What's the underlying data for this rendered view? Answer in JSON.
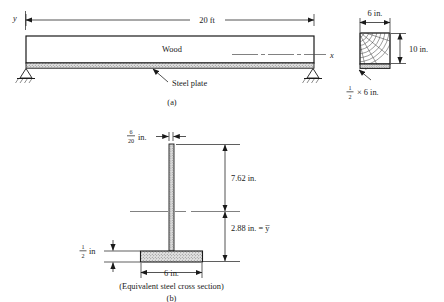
{
  "figure": {
    "title_a": "(a)",
    "title_b": "(b)",
    "caption_b": "(Equivalent steel cross section)"
  },
  "beam_elevation": {
    "span_label": "20 ft",
    "material_label": "Wood",
    "plate_label": "Steel plate",
    "axis_y_label": "y",
    "axis_x_label": "x"
  },
  "cross_section": {
    "width_label": "6 in.",
    "depth_label": "10 in.",
    "plate_label_numerator": "1",
    "plate_label_denominator": "2",
    "plate_label_suffix": "× 6 in."
  },
  "equivalent_section": {
    "web_width_numerator": "6",
    "web_width_denominator": "20",
    "web_width_unit": "in.",
    "upper_dim": "7.62 in.",
    "lower_dim": "2.88 in. = y̅",
    "flange_thickness_numerator": "1",
    "flange_thickness_denominator": "2",
    "flange_thickness_unit": "in",
    "flange_width": "6 in."
  },
  "colors": {
    "ink": "#1a1a1a",
    "steel_fill": "#d9d9d9",
    "wood_fill": "#ffffff",
    "background": "#ffffff"
  }
}
